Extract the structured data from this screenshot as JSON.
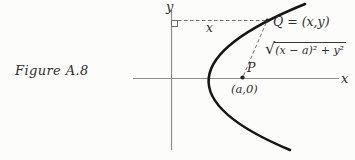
{
  "figure": {
    "caption": "Figure A.8",
    "labels": {
      "y_axis": "y",
      "x_axis": "x",
      "x_distance": "x",
      "q_point": "Q = (x,y)",
      "sqrt_symbol": "√",
      "radicand": "(x − a)² + y²",
      "p_point": "P",
      "p_coords": "(a,0)"
    },
    "colors": {
      "curve": "#161616",
      "axis": "#8d8d8d",
      "dashed": "#6f6f6f",
      "text": "#2e2e2e",
      "background": "#fcfcfa"
    }
  }
}
